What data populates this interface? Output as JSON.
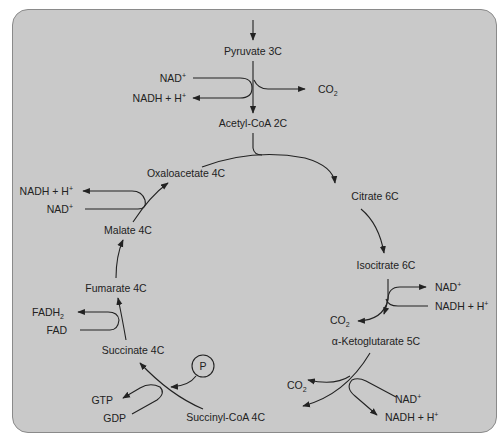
{
  "compounds": {
    "pyruvate": "Pyruvate 3C",
    "acetyl_coa": "Acetyl-CoA 2C",
    "citrate": "Citrate 6C",
    "isocitrate": "Isocitrate 6C",
    "alpha_ketoglutarate": "α-Ketoglutarate 5C",
    "succinyl_coa": "Succinyl-CoA 4C",
    "succinate": "Succinate 4C",
    "fumarate": "Fumarate 4C",
    "malate": "Malate 4C",
    "oxaloacetate": "Oxaloacetate 4C"
  },
  "cofactors": {
    "pyruvate_step": {
      "in": "NAD",
      "in_sup": "+",
      "out": "NADH + H",
      "out_sup": "+",
      "byproduct": "CO",
      "byproduct_sub": "2"
    },
    "isocitrate_step": {
      "nad": "NAD",
      "nad_sup": "+",
      "nadh": "NADH + H",
      "nadh_sup": "+",
      "byproduct": "CO",
      "byproduct_sub": "2"
    },
    "ketoglutarate_step": {
      "in": "NAD",
      "in_sup": "+",
      "out": "NADH + H",
      "out_sup": "+",
      "byproduct": "CO",
      "byproduct_sub": "2"
    },
    "succinyl_step": {
      "in": "GDP",
      "out": "GTP",
      "phosphate": "P"
    },
    "succinate_step": {
      "in": "FAD",
      "out": "FADH",
      "out_sub": "2"
    },
    "malate_step": {
      "in": "NAD",
      "in_sup": "+",
      "out": "NADH + H",
      "out_sup": "+"
    }
  },
  "colors": {
    "panel_bg": "#c9c9c9",
    "line": "#222222",
    "text": "#222222"
  }
}
